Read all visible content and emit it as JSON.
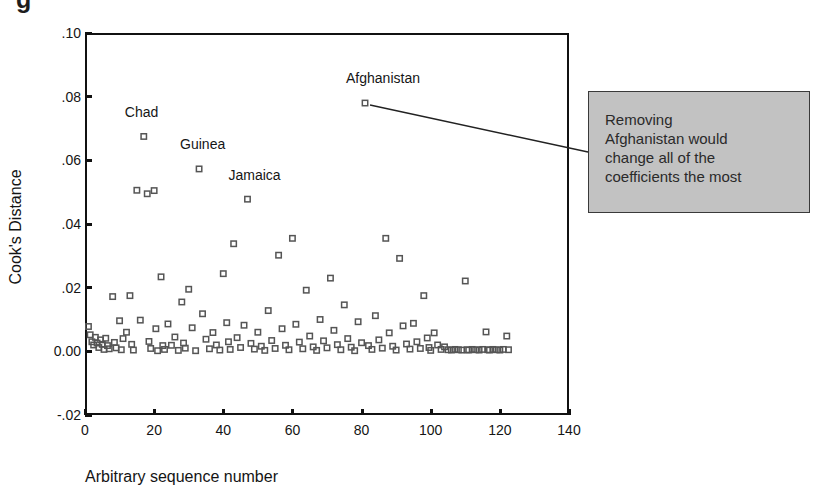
{
  "figure": {
    "top_clipped_glyph": "g",
    "background_color": "#ffffff"
  },
  "chart_data": {
    "type": "scatter",
    "title": "",
    "xlabel": "Arbitrary sequence number",
    "ylabel": "Cook's Distance",
    "xlim": [
      0,
      140
    ],
    "ylim": [
      -0.02,
      0.1
    ],
    "grid": false,
    "legend": "none",
    "xticks": [
      0,
      20,
      40,
      60,
      80,
      100,
      120,
      140
    ],
    "xtick_labels": [
      "0",
      "20",
      "40",
      "60",
      "80",
      "100",
      "120",
      "140"
    ],
    "yticks": [
      0.1,
      0.08,
      0.06,
      0.04,
      0.02,
      0.0,
      -0.02
    ],
    "ytick_labels": [
      ".10",
      ".08",
      ".06",
      ".04",
      ".02",
      "0.00",
      "-.02"
    ],
    "marker": "open-square",
    "marker_color": "#555555",
    "annotations": [
      {
        "text": "Chad",
        "x": 17,
        "y": 0.0675,
        "label_dx": -7,
        "label_dy": 0.0055
      },
      {
        "text": "Guinea",
        "x": 33,
        "y": 0.0573,
        "label_dx": -7,
        "label_dy": 0.0055
      },
      {
        "text": "Jamaica",
        "x": 47,
        "y": 0.0478,
        "label_dx": -7,
        "label_dy": 0.0055
      },
      {
        "text": "Afghanistan",
        "x": 81,
        "y": 0.078,
        "label_dx": -7,
        "label_dy": 0.0058
      }
    ],
    "callout": {
      "text": "Removing Afghanistan would change all of the coefficients the most",
      "lines": [
        "Removing",
        "Afghanistan would",
        "change all of the",
        "coefficients the most"
      ],
      "fill": "#c2c2c2",
      "border": "#3a3a3a",
      "leader_from": {
        "x": 81,
        "y": 0.078
      },
      "leader_to_px": {
        "x": 588,
        "y": 152
      }
    },
    "points": [
      [
        1,
        0.0078
      ],
      [
        1.5,
        0.0052
      ],
      [
        2,
        0.003
      ],
      [
        2.5,
        0.002
      ],
      [
        3,
        0.0044
      ],
      [
        3.5,
        0.0026
      ],
      [
        4,
        0.0012
      ],
      [
        4.5,
        0.0036
      ],
      [
        5,
        0.0022
      ],
      [
        5.5,
        0.0006
      ],
      [
        6,
        0.0041
      ],
      [
        6.5,
        0.0018
      ],
      [
        7,
        0.0008
      ],
      [
        8,
        0.0172
      ],
      [
        8.5,
        0.0028
      ],
      [
        9,
        0.0011
      ],
      [
        10,
        0.0096
      ],
      [
        10.5,
        0.0005
      ],
      [
        11,
        0.004
      ],
      [
        12,
        0.006
      ],
      [
        13,
        0.0175
      ],
      [
        13.5,
        0.0022
      ],
      [
        14,
        0.0004
      ],
      [
        15,
        0.0506
      ],
      [
        16,
        0.0098
      ],
      [
        17,
        0.0675
      ],
      [
        18,
        0.0495
      ],
      [
        18.5,
        0.0031
      ],
      [
        19,
        0.0009
      ],
      [
        20,
        0.0505
      ],
      [
        20.5,
        0.0071
      ],
      [
        21,
        0.0002
      ],
      [
        22,
        0.0234
      ],
      [
        22.5,
        0.0018
      ],
      [
        23,
        0.0006
      ],
      [
        24,
        0.0086
      ],
      [
        25,
        0.0019
      ],
      [
        26,
        0.0045
      ],
      [
        27,
        0.0003
      ],
      [
        28,
        0.0155
      ],
      [
        28.5,
        0.0026
      ],
      [
        29,
        0.001
      ],
      [
        30,
        0.0195
      ],
      [
        31,
        0.0074
      ],
      [
        32,
        0.0002
      ],
      [
        33,
        0.0573
      ],
      [
        34,
        0.0118
      ],
      [
        35,
        0.0038
      ],
      [
        36,
        0.0008
      ],
      [
        37,
        0.0059
      ],
      [
        38,
        0.002
      ],
      [
        39,
        0.0004
      ],
      [
        40,
        0.0244
      ],
      [
        41,
        0.009
      ],
      [
        41.5,
        0.003
      ],
      [
        42,
        0.0006
      ],
      [
        43,
        0.0338
      ],
      [
        44,
        0.0043
      ],
      [
        45,
        0.0012
      ],
      [
        46,
        0.0082
      ],
      [
        47,
        0.0478
      ],
      [
        48,
        0.0025
      ],
      [
        49,
        0.0007
      ],
      [
        50,
        0.006
      ],
      [
        51,
        0.0016
      ],
      [
        52,
        0.0003
      ],
      [
        53,
        0.0128
      ],
      [
        54,
        0.0034
      ],
      [
        55,
        0.0009
      ],
      [
        56,
        0.0302
      ],
      [
        57,
        0.0071
      ],
      [
        58,
        0.0019
      ],
      [
        59,
        0.0005
      ],
      [
        60,
        0.0355
      ],
      [
        61,
        0.0085
      ],
      [
        62,
        0.0029
      ],
      [
        63,
        0.0008
      ],
      [
        64,
        0.0192
      ],
      [
        65,
        0.0048
      ],
      [
        66,
        0.0014
      ],
      [
        67,
        0.0003
      ],
      [
        68,
        0.01
      ],
      [
        69,
        0.0033
      ],
      [
        70,
        0.0011
      ],
      [
        71,
        0.023
      ],
      [
        72,
        0.0066
      ],
      [
        73,
        0.0021
      ],
      [
        74,
        0.0005
      ],
      [
        75,
        0.0146
      ],
      [
        76,
        0.004
      ],
      [
        77,
        0.0013
      ],
      [
        78,
        0.0002
      ],
      [
        79,
        0.0093
      ],
      [
        80,
        0.0027
      ],
      [
        81,
        0.078
      ],
      [
        82,
        0.0018
      ],
      [
        83,
        0.0006
      ],
      [
        84,
        0.0112
      ],
      [
        85,
        0.0036
      ],
      [
        86,
        0.001
      ],
      [
        87,
        0.0355
      ],
      [
        88,
        0.0058
      ],
      [
        89,
        0.0016
      ],
      [
        90,
        0.0004
      ],
      [
        91,
        0.0292
      ],
      [
        92,
        0.008
      ],
      [
        93,
        0.0023
      ],
      [
        94,
        0.0007
      ],
      [
        95,
        0.0088
      ],
      [
        96,
        0.003
      ],
      [
        97,
        0.0009
      ],
      [
        98,
        0.0175
      ],
      [
        99,
        0.0042
      ],
      [
        99.5,
        0.0012
      ],
      [
        100,
        0.0003
      ],
      [
        101,
        0.0058
      ],
      [
        102,
        0.002
      ],
      [
        103,
        0.0006
      ],
      [
        104,
        0.0014
      ],
      [
        105,
        0.0005
      ],
      [
        106,
        0.0004
      ],
      [
        107,
        0.0006
      ],
      [
        108,
        0.0005
      ],
      [
        109,
        0.0004
      ],
      [
        110,
        0.0221
      ],
      [
        110.5,
        0.0005
      ],
      [
        111,
        0.0004
      ],
      [
        112,
        0.0006
      ],
      [
        113,
        0.0005
      ],
      [
        114,
        0.0004
      ],
      [
        115,
        0.0006
      ],
      [
        116,
        0.0061
      ],
      [
        116.5,
        0.0005
      ],
      [
        117,
        0.0004
      ],
      [
        118,
        0.0006
      ],
      [
        119,
        0.0005
      ],
      [
        120,
        0.0004
      ],
      [
        121,
        0.0006
      ],
      [
        122,
        0.0048
      ],
      [
        122.5,
        0.0005
      ]
    ]
  }
}
